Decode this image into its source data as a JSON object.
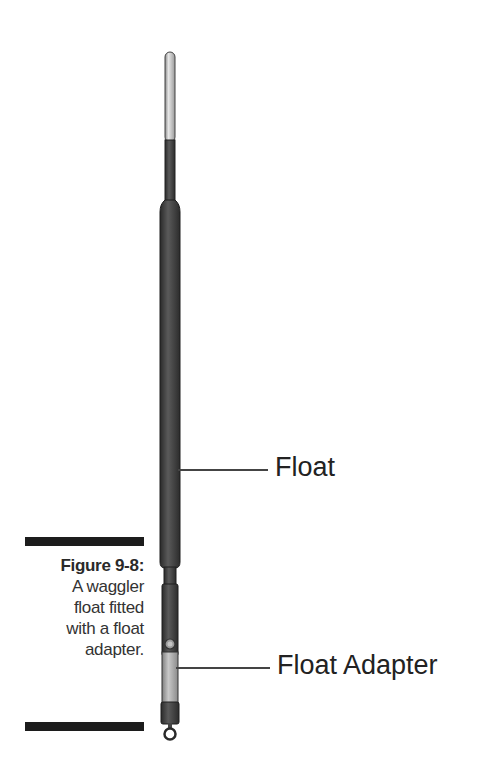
{
  "figure": {
    "number_label": "Figure 9-8:",
    "caption_lines": [
      "A waggler",
      "float fitted",
      "with a float",
      "adapter."
    ],
    "callouts": [
      {
        "label": "Float"
      },
      {
        "label": "Float Adapter"
      }
    ]
  },
  "colors": {
    "tip": "#d8d8d8",
    "stem": "#4a4a4a",
    "body": "#3e3e3e",
    "adapter_light": "#b9b9b9",
    "collar": "#2f2f2f",
    "rule_bars": "#1c1c1c"
  }
}
